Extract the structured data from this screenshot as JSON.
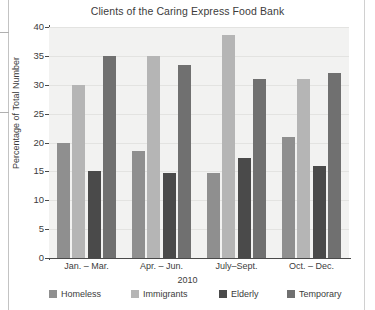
{
  "chart_data": {
    "type": "bar",
    "title": "Clients of the Caring Express Food Bank",
    "xlabel": "2010",
    "ylabel": "Percentage of Total Number",
    "categories": [
      "Jan. – Mar.",
      "Apr. – Jun.",
      "July–Sept.",
      "Oct. – Dec."
    ],
    "series": [
      {
        "name": "Homeless",
        "color": "#8f8f8f",
        "values": [
          20.0,
          18.6,
          14.7,
          21.0
        ]
      },
      {
        "name": "Immigrants",
        "color": "#b5b5b5",
        "values": [
          30.0,
          35.0,
          38.7,
          31.0
        ]
      },
      {
        "name": "Elderly",
        "color": "#4a4a4a",
        "values": [
          15.0,
          14.7,
          17.3,
          16.0
        ]
      },
      {
        "name": "Temporary",
        "color": "#707070",
        "values": [
          35.0,
          33.4,
          31.0,
          32.0
        ]
      }
    ],
    "ylim": [
      0,
      40
    ],
    "yticks": [
      0,
      5,
      10,
      15,
      20,
      25,
      30,
      35,
      40
    ],
    "ytick_labels": [
      "0",
      "5",
      "10",
      "15",
      "20",
      "25",
      "30",
      "35",
      "40"
    ],
    "grid": true,
    "legend_position": "bottom",
    "plot_background": "#f2f2f1"
  }
}
